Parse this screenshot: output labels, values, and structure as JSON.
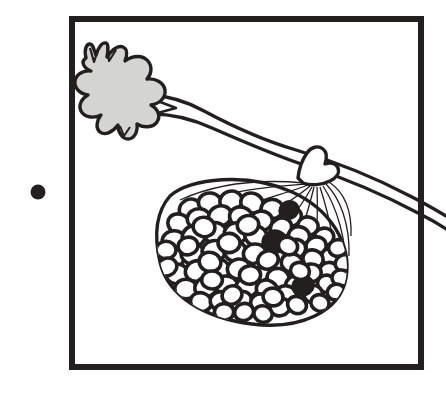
{
  "figure": {
    "caption": "",
    "kind": "botanical-line-illustration",
    "background_color": "#ffffff",
    "ink_color": "#241f1f",
    "leaf_fill_color": "#d4d5d3",
    "berry_fill_color": "#ffffff",
    "canvas": {
      "width": 446,
      "height": 397
    }
  },
  "bullet": {
    "label": "",
    "shape": "filled-circle",
    "color": "#241f1f",
    "center_x": 38,
    "center_y": 192,
    "radius": 7.5
  },
  "frame": {
    "label": "",
    "stroke_color": "#241f1f",
    "stroke_width": 6,
    "x": 72,
    "y": 19,
    "width": 349,
    "height": 348
  },
  "leaf": {
    "label": "",
    "fill": "#d4d5d3",
    "stroke": "#241f1f",
    "stroke_width": 3.4,
    "lobes": 9,
    "center_x": 117,
    "center_y": 90
  },
  "branch": {
    "label": "",
    "stroke": "#241f1f",
    "stroke_width": 3.2,
    "from_x": 148,
    "from_y": 100,
    "to_x": 446,
    "to_y": 200
  },
  "fruit": {
    "label": "",
    "stroke": "#241f1f",
    "outline_stroke_width": 3.4,
    "rib_stroke_width": 1.2,
    "ribs": 11,
    "center_x": 265,
    "center_y": 240,
    "radius_x": 92,
    "radius_y": 75,
    "berry_count": 78,
    "dark_berry_count": 3,
    "berry_stroke_width": 3.6,
    "berries": [
      [
        190,
        209,
        11.0,
        9.6,
        0
      ],
      [
        210,
        203,
        11.6,
        10.0,
        0
      ],
      [
        231,
        201,
        11.2,
        9.8,
        0
      ],
      [
        252,
        203,
        11.4,
        9.8,
        0
      ],
      [
        272,
        209,
        11.0,
        9.6,
        0
      ],
      [
        291,
        217,
        10.6,
        9.2,
        0
      ],
      [
        308,
        226,
        10.2,
        9.0,
        0
      ],
      [
        324,
        237,
        9.8,
        8.8,
        0
      ],
      [
        179,
        224,
        11.4,
        9.8,
        0
      ],
      [
        199,
        219,
        11.8,
        10.2,
        0
      ],
      [
        220,
        216,
        11.6,
        10.0,
        0
      ],
      [
        241,
        217,
        11.6,
        10.0,
        0
      ],
      [
        261,
        221,
        11.4,
        9.8,
        0
      ],
      [
        281,
        228,
        11.0,
        9.6,
        0
      ],
      [
        299,
        236,
        10.6,
        9.2,
        0
      ],
      [
        316,
        246,
        10.2,
        9.0,
        0
      ],
      [
        331,
        257,
        9.6,
        8.6,
        0
      ],
      [
        174,
        241,
        11.8,
        10.2,
        0
      ],
      [
        194,
        236,
        12.0,
        10.4,
        0
      ],
      [
        215,
        233,
        12.0,
        10.4,
        0
      ],
      [
        236,
        233,
        11.8,
        10.2,
        0
      ],
      [
        256,
        236,
        11.6,
        10.0,
        0
      ],
      [
        276,
        242,
        11.2,
        9.8,
        0
      ],
      [
        295,
        249,
        10.8,
        9.4,
        0
      ],
      [
        313,
        259,
        10.2,
        9.0,
        0
      ],
      [
        329,
        271,
        9.6,
        8.6,
        0
      ],
      [
        173,
        258,
        11.8,
        10.2,
        0
      ],
      [
        193,
        254,
        12.0,
        10.4,
        0
      ],
      [
        214,
        251,
        12.0,
        10.4,
        0
      ],
      [
        235,
        251,
        11.8,
        10.2,
        0
      ],
      [
        255,
        254,
        11.6,
        10.0,
        0
      ],
      [
        274,
        241,
        11.0,
        9.6,
        1
      ],
      [
        292,
        263,
        10.8,
        9.4,
        0
      ],
      [
        311,
        273,
        10.2,
        9.0,
        0
      ],
      [
        327,
        284,
        9.6,
        8.6,
        0
      ],
      [
        177,
        274,
        11.6,
        10.0,
        0
      ],
      [
        197,
        271,
        11.8,
        10.2,
        0
      ],
      [
        218,
        269,
        11.8,
        10.2,
        0
      ],
      [
        239,
        269,
        11.6,
        10.0,
        0
      ],
      [
        259,
        272,
        11.4,
        9.8,
        0
      ],
      [
        278,
        278,
        11.0,
        9.6,
        0
      ],
      [
        296,
        285,
        10.6,
        9.2,
        0
      ],
      [
        313,
        294,
        10.0,
        8.8,
        0
      ],
      [
        186,
        289,
        11.2,
        9.8,
        0
      ],
      [
        206,
        287,
        11.4,
        9.8,
        0
      ],
      [
        227,
        286,
        11.4,
        9.8,
        0
      ],
      [
        247,
        287,
        11.2,
        9.8,
        0
      ],
      [
        267,
        290,
        11.0,
        9.6,
        0
      ],
      [
        286,
        295,
        10.6,
        9.2,
        0
      ],
      [
        303,
        286,
        10.0,
        8.8,
        1
      ],
      [
        201,
        302,
        10.6,
        9.2,
        0
      ],
      [
        221,
        301,
        10.8,
        9.4,
        0
      ],
      [
        241,
        301,
        10.8,
        9.4,
        0
      ],
      [
        261,
        303,
        10.4,
        9.0,
        0
      ],
      [
        280,
        307,
        10.0,
        8.8,
        0
      ],
      [
        297,
        305,
        9.6,
        8.4,
        0
      ],
      [
        224,
        312,
        9.6,
        8.4,
        0
      ],
      [
        244,
        312,
        9.6,
        8.4,
        0
      ],
      [
        263,
        314,
        9.2,
        8.2,
        0
      ],
      [
        338,
        248,
        9.4,
        8.4,
        0
      ],
      [
        344,
        263,
        9.0,
        8.0,
        0
      ],
      [
        341,
        278,
        9.0,
        8.0,
        0
      ],
      [
        336,
        292,
        8.8,
        7.8,
        0
      ],
      [
        320,
        303,
        9.2,
        8.2,
        0
      ],
      [
        166,
        250,
        10.0,
        8.8,
        0
      ],
      [
        167,
        267,
        10.0,
        8.8,
        0
      ],
      [
        204,
        227,
        11.0,
        9.6,
        0
      ],
      [
        248,
        225,
        10.8,
        9.4,
        0
      ],
      [
        288,
        246,
        9.8,
        8.6,
        0
      ],
      [
        229,
        243,
        11.0,
        9.6,
        0
      ],
      [
        268,
        260,
        10.4,
        9.0,
        0
      ],
      [
        210,
        262,
        11.0,
        9.6,
        0
      ],
      [
        250,
        275,
        10.6,
        9.2,
        0
      ],
      [
        232,
        295,
        10.2,
        9.0,
        0
      ],
      [
        273,
        297,
        10.0,
        8.8,
        0
      ],
      [
        188,
        246,
        10.0,
        8.8,
        0
      ],
      [
        300,
        271,
        9.6,
        8.4,
        0
      ],
      [
        212,
        280,
        10.4,
        9.0,
        0
      ],
      [
        289,
        210,
        9.0,
        8.0,
        1
      ]
    ]
  },
  "stem": {
    "label": "",
    "stroke": "#241f1f",
    "stroke_width": 3.4,
    "top_x": 310,
    "top_y": 150
  }
}
